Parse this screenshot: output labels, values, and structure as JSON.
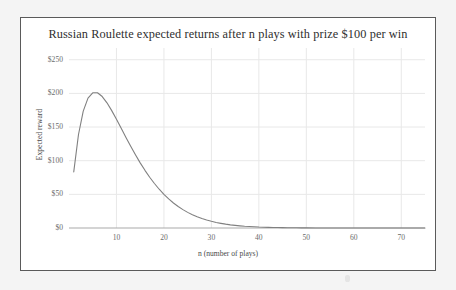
{
  "chart_data": {
    "type": "line",
    "title": "Russian Roulette expected returns after n plays with prize $100 per win",
    "xlabel": "n (number of plays)",
    "ylabel": "Expected reward",
    "xlim": [
      0,
      75
    ],
    "ylim": [
      0,
      260
    ],
    "grid": true,
    "legend": null,
    "x_ticks": [
      10,
      20,
      30,
      40,
      50,
      60,
      70
    ],
    "x_tick_labels": [
      "10",
      "20",
      "30",
      "40",
      "50",
      "60",
      "70"
    ],
    "y_ticks": [
      0,
      50,
      100,
      150,
      200,
      250
    ],
    "y_tick_labels": [
      "$0",
      "$50",
      "$100",
      "$150",
      "$200",
      "$250"
    ],
    "series": [
      {
        "name": "Expected reward",
        "color": "#808080",
        "x": [
          1,
          2,
          3,
          4,
          5,
          6,
          7,
          8,
          9,
          10,
          11,
          12,
          13,
          14,
          15,
          16,
          17,
          18,
          19,
          20,
          21,
          22,
          23,
          24,
          25,
          26,
          27,
          28,
          29,
          30,
          31,
          32,
          33,
          34,
          35,
          36,
          37,
          38,
          39,
          40,
          41,
          42,
          43,
          44,
          45,
          46,
          47,
          48,
          49,
          50,
          52,
          54,
          56,
          58,
          60,
          62,
          64,
          66,
          68,
          70,
          72,
          75
        ],
        "values": [
          83.3,
          138.9,
          173.6,
          192.9,
          200.9,
          200.9,
          195.3,
          186.0,
          174.4,
          161.5,
          148.1,
          134.6,
          121.4,
          108.8,
          96.8,
          85.7,
          75.4,
          66.1,
          57.6,
          50.0,
          43.2,
          37.2,
          31.9,
          27.3,
          23.2,
          19.7,
          16.7,
          14.1,
          11.8,
          9.9,
          8.2,
          6.9,
          5.7,
          4.7,
          3.9,
          3.2,
          2.6,
          2.2,
          1.8,
          1.4,
          1.2,
          0.97,
          0.79,
          0.64,
          0.52,
          0.42,
          0.34,
          0.27,
          0.22,
          0.18,
          0.11,
          0.07,
          0.05,
          0.03,
          0.02,
          0.012,
          0.008,
          0.005,
          0.003,
          0.002,
          0.001,
          0.0005
        ],
        "formula_note": "100 * n * (5/6)^n"
      }
    ],
    "peak": {
      "n": 6,
      "value": 201
    }
  },
  "colors": {
    "page_background": "#f4f4f4",
    "card_background": "#ffffff",
    "card_border": "#5a5a5a",
    "title_text": "#2f2f2f",
    "tick_text": "#6b6b6b",
    "axis_label_text": "#4a4a4a",
    "grid_line": "#e8e8e8",
    "axis_line": "#a9a9a9",
    "curve": "#808080"
  }
}
